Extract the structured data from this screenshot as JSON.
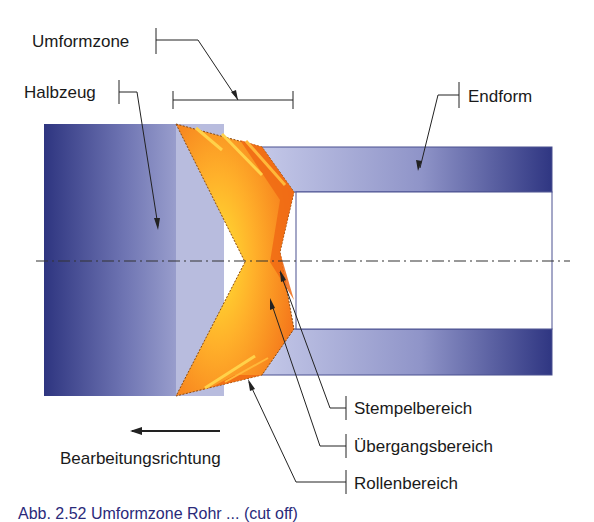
{
  "diagram": {
    "labels": {
      "umformzone": "Umformzone",
      "halbzeug": "Halbzeug",
      "endform": "Endform",
      "stempelbereich": "Stempelbereich",
      "uebergangsbereich": "Übergangsbereich",
      "rollenbereich": "Rollenbereich",
      "bearbeitungsrichtung": "Bearbeitungsrichtung"
    },
    "caption": "Abb. 2.52 Umformzone Rohr ... (cut off)",
    "colors": {
      "blank_dark": "#2e3580",
      "blank_light": "#b9bde0",
      "zone_orange": "#f57f1f",
      "zone_yellow": "#ffd92e",
      "outline": "#444c8c",
      "text": "#1a1a1a"
    }
  }
}
